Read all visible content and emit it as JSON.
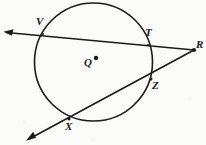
{
  "figure": {
    "type": "geometry-diagram",
    "background_color": "#fbfbfa",
    "stroke_color": "#1a1a1a",
    "width": 206,
    "height": 145
  },
  "circle": {
    "name": "circle-Q",
    "center_label": "Q",
    "center_x": 93.5,
    "center_y": 62,
    "radius": 59,
    "center_dot_x": 96,
    "center_dot_y": 58,
    "center_label_x": 85,
    "center_label_y": 63
  },
  "points": [
    {
      "id": "V",
      "label": "V",
      "x": 43,
      "y": 34,
      "label_x": 37,
      "label_y": 18
    },
    {
      "id": "T",
      "label": "T",
      "x": 148,
      "y": 45,
      "label_x": 146,
      "label_y": 29
    },
    {
      "id": "R",
      "label": "R",
      "x": 194,
      "y": 50,
      "label_x": 196,
      "label_y": 40
    },
    {
      "id": "Z",
      "label": "Z",
      "x": 151,
      "y": 79,
      "label_x": 152,
      "label_y": 80
    },
    {
      "id": "X",
      "label": "X",
      "x": 69,
      "y": 119,
      "label_x": 66,
      "label_y": 122
    },
    {
      "id": "Q",
      "label": "Q",
      "x": 96,
      "y": 58,
      "label_x": 85,
      "label_y": 63
    }
  ],
  "secants": [
    {
      "name": "secant-VTR",
      "through": "V, T, R",
      "arrow_end": "left",
      "arrow_tip_x": 5,
      "arrow_tip_y": 32,
      "end_x": 194,
      "end_y": 50
    },
    {
      "name": "secant-XZR",
      "through": "X, Z, R",
      "arrow_end": "bottom-left",
      "arrow_tip_x": 27,
      "arrow_tip_y": 140,
      "end_x": 194,
      "end_y": 50
    }
  ],
  "labels": {
    "V": "V",
    "T": "T",
    "R": "R",
    "Z": "Z",
    "X": "X",
    "Q": "Q"
  }
}
